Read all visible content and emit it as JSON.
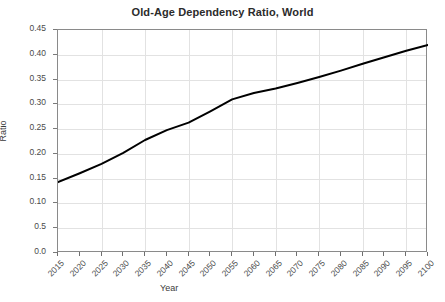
{
  "chart_data": {
    "type": "line",
    "title": "Old-Age Dependency Ratio, World",
    "xlabel": "Year",
    "ylabel": "Ratio",
    "x": [
      2015,
      2020,
      2025,
      2030,
      2035,
      2040,
      2045,
      2050,
      2055,
      2060,
      2065,
      2070,
      2075,
      2080,
      2085,
      2090,
      2095,
      2100
    ],
    "values": [
      0.143,
      0.161,
      0.18,
      0.202,
      0.228,
      0.248,
      0.263,
      0.286,
      0.31,
      0.323,
      0.332,
      0.343,
      0.355,
      0.368,
      0.382,
      0.395,
      0.408,
      0.42
    ],
    "series": [
      {
        "name": "Old-Age Dependency Ratio, World",
        "values": [
          0.143,
          0.161,
          0.18,
          0.202,
          0.228,
          0.248,
          0.263,
          0.286,
          0.31,
          0.323,
          0.332,
          0.343,
          0.355,
          0.368,
          0.382,
          0.395,
          0.408,
          0.42
        ],
        "color": "#000000"
      }
    ],
    "xlim": [
      2015,
      2100
    ],
    "ylim": [
      0.0,
      0.45
    ],
    "x_tick_labels": [
      "2015",
      "2020",
      "2025",
      "2030",
      "2035",
      "2040",
      "2045",
      "2050",
      "2055",
      "2060",
      "2065",
      "2070",
      "2075",
      "2080",
      "2085",
      "2090",
      "2095",
      "2100"
    ],
    "y_ticks": [
      0.45,
      0.4,
      0.35,
      0.3,
      0.25,
      0.2,
      0.15,
      0.1,
      0.05,
      0.0
    ],
    "y_tick_labels": [
      "0.45",
      "0.40",
      "0.35",
      "0.30",
      "0.25",
      "0.20",
      "0.15",
      "0.10",
      "0.5",
      "0.0"
    ],
    "grid": true,
    "grid_color": "#e2e2e2",
    "legend": "none",
    "x_gridline_years": [
      2025,
      2035,
      2045,
      2055,
      2065,
      2075,
      2085,
      2095
    ],
    "line_color": "#000000",
    "axis_color": "#8a8a8a",
    "background": "#ffffff"
  }
}
